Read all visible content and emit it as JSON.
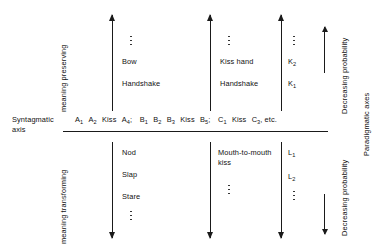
{
  "diagram": {
    "ink_color": "#1a1a1a",
    "background": "#ffffff"
  },
  "axes": {
    "syntagmatic_label_line1": "Syntagmatic",
    "syntagmatic_label_line2": "axis",
    "paradigmatic_label": "Paradigmatic axes",
    "meaning_preserving_label": "meaning preserving",
    "meaning_transforming_label": "meaning transforming",
    "decreasing_probability_upper": "Decreasing probability",
    "decreasing_probability_lower": "Decreasing probability"
  },
  "syntagmatic_sequence": {
    "items": [
      {
        "base": "A",
        "sub": "1"
      },
      {
        "base": "A",
        "sub": "2"
      },
      {
        "base": "Kiss",
        "sub": ""
      },
      {
        "base": "A",
        "sub": "4"
      },
      {
        "base": ";",
        "sub": ""
      },
      {
        "base": "B",
        "sub": "1"
      },
      {
        "base": "B",
        "sub": "2"
      },
      {
        "base": "B",
        "sub": "3"
      },
      {
        "base": "Kiss",
        "sub": ""
      },
      {
        "base": "B",
        "sub": "5"
      },
      {
        "base": ";",
        "sub": ""
      },
      {
        "base": "C",
        "sub": "1"
      },
      {
        "base": "Kiss",
        "sub": ""
      },
      {
        "base": "C",
        "sub": "3"
      },
      {
        "base": ", etc.",
        "sub": ""
      }
    ]
  },
  "upper_columns": [
    {
      "name": "column-bow-handshake",
      "arrow_direction": "up",
      "entries": [
        {
          "base": "Bow",
          "sub": ""
        },
        {
          "base": "Handshake",
          "sub": ""
        }
      ],
      "has_ellipsis": true
    },
    {
      "name": "column-kiss-hand-handshake",
      "arrow_direction": "up",
      "entries": [
        {
          "base": "Kiss hand",
          "sub": ""
        },
        {
          "base": "Handshake",
          "sub": ""
        }
      ],
      "has_ellipsis": true
    },
    {
      "name": "column-k-series",
      "arrow_direction": "up",
      "entries": [
        {
          "base": "K",
          "sub": "2"
        },
        {
          "base": "K",
          "sub": "1"
        }
      ],
      "has_ellipsis": true
    }
  ],
  "lower_columns": [
    {
      "name": "column-nod-slap-stare",
      "arrow_direction": "down",
      "entries": [
        {
          "base": "Nod",
          "sub": ""
        },
        {
          "base": "Slap",
          "sub": ""
        },
        {
          "base": "Stare",
          "sub": ""
        }
      ],
      "has_ellipsis": true
    },
    {
      "name": "column-mouth-to-mouth-kiss",
      "arrow_direction": "down",
      "entries": [
        {
          "base": "Mouth-to-mouth kiss",
          "sub": ""
        }
      ],
      "has_ellipsis": true
    },
    {
      "name": "column-l-series",
      "arrow_direction": "down",
      "entries": [
        {
          "base": "L",
          "sub": "1"
        },
        {
          "base": "L",
          "sub": "2"
        }
      ],
      "has_ellipsis": true
    }
  ]
}
